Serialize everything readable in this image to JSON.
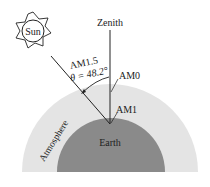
{
  "diagram": {
    "labels": {
      "sun": "Sun",
      "zenith": "Zenith",
      "am15": "AM1.5",
      "theta": "θ = 48.2°",
      "am0": "AM0",
      "am1": "AM1",
      "atmosphere": "Atmosphere",
      "earth": "Earth"
    },
    "colors": {
      "atmosphere": "#e4e4e4",
      "earth": "#8a8a8a",
      "line": "#222222"
    },
    "angle_deg": 48.2
  }
}
